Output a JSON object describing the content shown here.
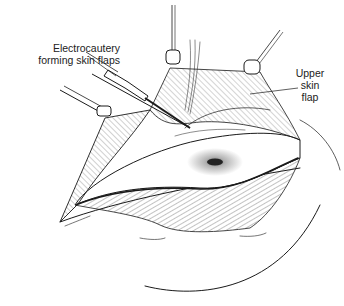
{
  "figure": {
    "type": "surgical-illustration",
    "labels": {
      "electrocautery": [
        "Electrocautery",
        "forming skin flaps"
      ],
      "upper_flap": [
        "Upper",
        "skin",
        "flap"
      ]
    },
    "colors": {
      "ink": "#1a1a1a",
      "background": "#ffffff"
    }
  }
}
